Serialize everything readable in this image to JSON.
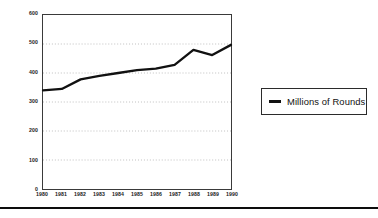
{
  "chart_data": {
    "type": "line",
    "title": "",
    "subtitle": "",
    "xlabel": "",
    "ylabel": "",
    "categories": [
      "1980",
      "1981",
      "1982",
      "1983",
      "1984",
      "1985",
      "1986",
      "1987",
      "1988",
      "1989",
      "1990"
    ],
    "series": [
      {
        "name": "Millions of Rounds",
        "values": [
          340,
          345,
          378,
          390,
          400,
          410,
          415,
          428,
          480,
          462,
          497
        ],
        "color": "#111111"
      }
    ],
    "ylim": [
      0,
      600
    ],
    "yticks": [
      0,
      100,
      200,
      300,
      400,
      500,
      600
    ],
    "ytick_labels": [
      "0",
      "100",
      "200",
      "300",
      "400",
      "500",
      "600"
    ],
    "xtick_labels": [
      "1980",
      "1981",
      "1982",
      "1983",
      "1984",
      "1985",
      "1986",
      "1987",
      "1988",
      "1989",
      "1990"
    ],
    "grid": {
      "horizontal": true,
      "vertical": false,
      "style": "dotted",
      "levels": [
        100,
        200,
        300,
        400,
        500
      ]
    },
    "legend": {
      "position": "right",
      "boxed": true,
      "entries": [
        {
          "label": "Millions of Rounds",
          "marker": "line-swatch",
          "color": "#111111"
        }
      ]
    },
    "axis_color": "#3a3a3a",
    "grid_color": "#8a8a8a",
    "background": "#ffffff"
  },
  "figure": {
    "bottom_rule_color": "#0d0d0d"
  }
}
